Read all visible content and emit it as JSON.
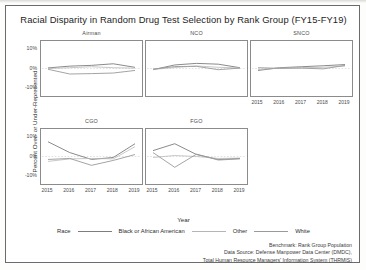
{
  "chart_data": {
    "type": "line",
    "title": "Racial Disparity in Random Drug Test Selection by Rank Group (FY15-FY19)",
    "xlabel": "Year",
    "ylabel": "Percent Over- or Under-Represented",
    "x": [
      2015,
      2016,
      2017,
      2018,
      2019
    ],
    "xtick_labels": [
      "2015",
      "2016",
      "2017",
      "2018",
      "2019"
    ],
    "ytick_labels": [
      "10%",
      "0%",
      "-10%"
    ],
    "ytick_values": [
      10,
      0,
      -10
    ],
    "ylim": [
      -14,
      14
    ],
    "grid": false,
    "legend_title": "Race",
    "legend_position": "bottom",
    "series_names": [
      "Black or African American",
      "Other",
      "White"
    ],
    "series_colors": [
      "#7d7d7d",
      "#b5b5b5",
      "#9a9a9a"
    ],
    "panels": [
      {
        "name": "Airman",
        "series": [
          {
            "name": "Black or African American",
            "values": [
              0.3,
              1.2,
              1.6,
              2.4,
              0.6
            ]
          },
          {
            "name": "Other",
            "values": [
              0.0,
              0.4,
              0.9,
              0.4,
              0.2
            ]
          },
          {
            "name": "White",
            "values": [
              -0.4,
              -2.8,
              -2.6,
              -2.3,
              -1.0
            ]
          }
        ]
      },
      {
        "name": "NCO",
        "series": [
          {
            "name": "Black or African American",
            "values": [
              -0.6,
              1.8,
              2.6,
              2.2,
              0.4
            ]
          },
          {
            "name": "Other",
            "values": [
              -0.5,
              0.5,
              1.3,
              0.6,
              0.3
            ]
          },
          {
            "name": "White",
            "values": [
              -0.3,
              1.0,
              1.1,
              -0.6,
              0.2
            ]
          }
        ]
      },
      {
        "name": "SNCO",
        "series": [
          {
            "name": "Black or African American",
            "values": [
              -1.0,
              0.4,
              0.9,
              1.4,
              2.0
            ]
          },
          {
            "name": "Other",
            "values": [
              -0.5,
              0.2,
              0.4,
              0.6,
              1.2
            ]
          },
          {
            "name": "White",
            "values": [
              0.4,
              0.1,
              0.2,
              -0.2,
              1.6
            ]
          }
        ]
      },
      {
        "name": "CGO",
        "series": [
          {
            "name": "Black or African American",
            "values": [
              7.5,
              2.0,
              -1.5,
              -0.5,
              6.5
            ]
          },
          {
            "name": "Other",
            "values": [
              -2.5,
              -1.2,
              -1.0,
              -1.2,
              5.0
            ]
          },
          {
            "name": "White",
            "values": [
              -1.5,
              -1.0,
              -4.5,
              -2.0,
              1.0
            ]
          }
        ]
      },
      {
        "name": "FGO",
        "series": [
          {
            "name": "Black or African American",
            "values": [
              3.0,
              6.5,
              1.0,
              -1.5,
              -1.0
            ]
          },
          {
            "name": "Other",
            "values": [
              -0.5,
              0.5,
              0.0,
              -1.0,
              -0.8
            ]
          },
          {
            "name": "White",
            "values": [
              2.0,
              -5.5,
              1.2,
              -1.8,
              -1.2
            ]
          }
        ]
      }
    ],
    "footnote": [
      "Benchmark: Rank Group Population",
      "Data Source: Defense Manpower Data Center (DMDC),",
      "Total Human Resource Managers' Information System (THRMIS)"
    ]
  }
}
